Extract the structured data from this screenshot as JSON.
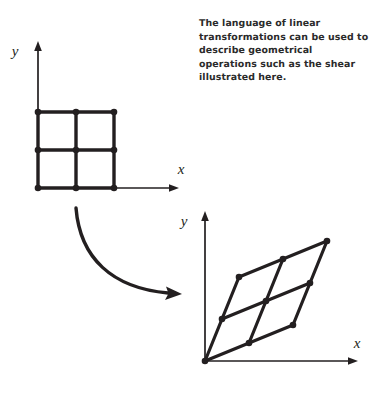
{
  "figure": {
    "caption": "The language of linear transformations can be used to describe geometrical operations such as the shear illustrated here.",
    "background_color": "#ffffff",
    "ink_color": "#231f20",
    "text_color": "#2b2b2b",
    "source": {
      "label": "source-grid",
      "x_axis_label": "x",
      "y_axis_label": "y",
      "description": "square grid, 2 by 2 cells, resting on the x-axis with its left edge on the y-axis",
      "origin_px": [
        38,
        188
      ],
      "cell_size_px": 38,
      "cols": 2,
      "rows": 2,
      "basis_e1_px": [
        38,
        0
      ],
      "basis_e2_px": [
        0,
        -38
      ],
      "y_axis_tip_px": [
        38,
        42
      ],
      "x_axis_tip_px": [
        178,
        188
      ],
      "x_label_px": [
        181,
        174
      ],
      "y_label_px": [
        15,
        56
      ]
    },
    "target": {
      "label": "sheared-grid",
      "x_axis_label": "x",
      "y_axis_label": "y",
      "description": "sheared parallelogram grid, 2 by 2 cells, bottom-left vertex at the origin",
      "origin_px": [
        205,
        361
      ],
      "cols": 2,
      "rows": 2,
      "basis_e1_px": [
        44,
        -18
      ],
      "basis_e2_px": [
        17,
        -42
      ],
      "y_axis_tip_px": [
        205,
        212
      ],
      "x_axis_tip_px": [
        357,
        361
      ],
      "x_label_px": [
        357,
        348
      ],
      "y_label_px": [
        184,
        226
      ]
    },
    "arrow": {
      "label": "transformation-arrow",
      "start_px": [
        76,
        208
      ],
      "end_px": [
        181,
        294
      ],
      "control_px": [
        86,
        285
      ],
      "style": "curved-with-arrowhead"
    }
  }
}
